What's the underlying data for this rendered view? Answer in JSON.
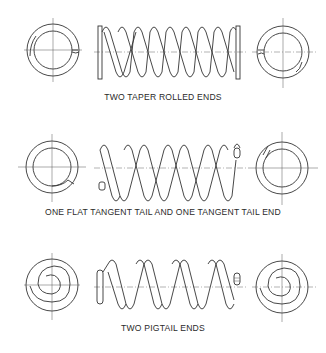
{
  "figure": {
    "rows": [
      {
        "id": "taper-rolled",
        "label": "TWO TAPER ROLLED ENDS",
        "end_type_left": "taper-rolled",
        "end_type_right": "taper-rolled",
        "active_coils": 7
      },
      {
        "id": "tangent-tail",
        "label": "ONE FLAT TANGENT TAIL AND ONE TANGENT TAIL END",
        "end_type_left": "flat-tangent-tail",
        "end_type_right": "tangent-tail",
        "active_coils": 7
      },
      {
        "id": "pigtail",
        "label": "TWO PIGTAIL ENDS",
        "end_type_left": "pigtail",
        "end_type_right": "pigtail",
        "active_coils": 5
      }
    ],
    "colors": {
      "line": "#333333",
      "background": "#ffffff"
    }
  }
}
